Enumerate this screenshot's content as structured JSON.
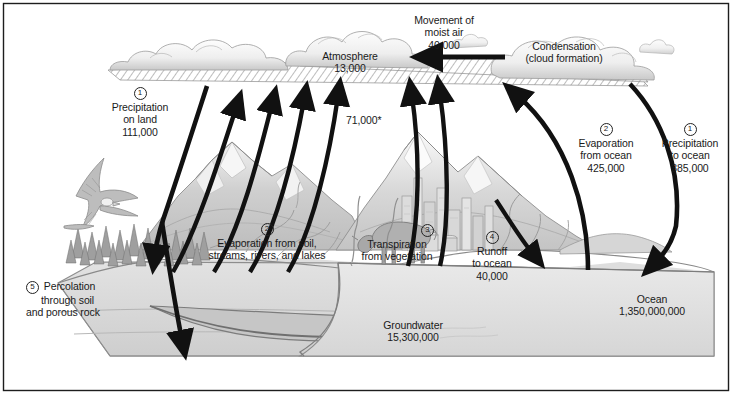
{
  "figure": {
    "units_note": "71,000*",
    "background_color": "#ffffff",
    "ink_color": "#1a1a1a"
  },
  "reservoirs": [
    {
      "name": "atmosphere",
      "label": "Atmosphere",
      "value": "13,000"
    },
    {
      "name": "groundwater",
      "label": "Groundwater",
      "value": "15,300,000"
    },
    {
      "name": "ocean",
      "label": "Ocean",
      "value": "1,350,000,000"
    }
  ],
  "fluxes": [
    {
      "number": "1",
      "name": "precipitation-on-land",
      "line1": "Precipitation",
      "line2": "on land",
      "value": "111,000"
    },
    {
      "number": "2",
      "name": "evaporation-from-land",
      "line1": "Evaporation from soil,",
      "line2": "streams, rivers, and lakes",
      "value": ""
    },
    {
      "number": "3",
      "name": "transpiration",
      "line1": "Transpiration",
      "line2": "from vegetation",
      "value": ""
    },
    {
      "number": "4",
      "name": "runoff-to-ocean",
      "line1": "Runoff",
      "line2": "to ocean",
      "value": "40,000"
    },
    {
      "number": "5",
      "name": "percolation",
      "line1": "Percolation",
      "line2": "through soil",
      "line3": "and porous rock",
      "value": ""
    },
    {
      "number": "2",
      "name": "evaporation-from-ocean",
      "line1": "Evaporation",
      "line2": "from ocean",
      "value": "425,000"
    },
    {
      "number": "1",
      "name": "precipitation-to-ocean",
      "line1": "Precipitation",
      "line2": "to ocean",
      "value": "385,000"
    }
  ],
  "processes": [
    {
      "name": "movement-of-moist-air",
      "line1": "Movement of",
      "line2": "moist air",
      "value": "40,000"
    },
    {
      "name": "condensation",
      "line1": "Condensation",
      "line2": "(cloud formation)",
      "value": ""
    }
  ],
  "landland_combined_flux": "71,000*"
}
